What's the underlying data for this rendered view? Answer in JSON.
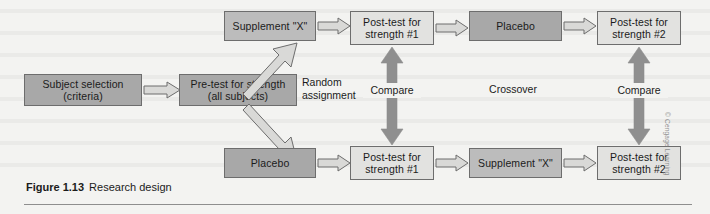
{
  "figure": {
    "number": "Figure 1.13",
    "caption": "Research design",
    "credit": "© Cengage Learning"
  },
  "diagram": {
    "type": "flowchart",
    "title": "Research design",
    "intake": {
      "subject_selection": "Subject selection\n(criteria)",
      "pre_test": "Pre-test for strength\n(all subjects)",
      "random_assignment": "Random\nassignment"
    },
    "group_top": {
      "treatment_1": "Supplement \"X\"",
      "post_test_1": "Post-test for\nstrength #1",
      "treatment_2": "Placebo",
      "post_test_2": "Post-test for\nstrength #2"
    },
    "group_bottom": {
      "treatment_1": "Placebo",
      "post_test_1": "Post-test for\nstrength #1",
      "treatment_2": "Supplement \"X\"",
      "post_test_2": "Post-test for\nstrength #2"
    },
    "connectors": {
      "compare_left": "Compare",
      "compare_right": "Compare",
      "crossover": "Crossover"
    },
    "colors": {
      "box_dark": "#a8a8a8",
      "box_medium": "#bcbcbc",
      "box_light": "#e2e2e0",
      "box_border": "#6d6d6d",
      "arrow_hollow_fill": "#d9d9d7",
      "arrow_hollow_stroke": "#6d6d6d",
      "arrow_solid_fill": "#8f8f8f",
      "page_background": "#f3f3f1",
      "text": "#1b1b1b",
      "rule": "#8e8e8e"
    }
  }
}
